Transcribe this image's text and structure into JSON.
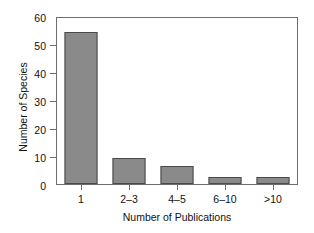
{
  "chart_data": {
    "type": "bar",
    "title": "",
    "subtitle": "",
    "xlabel": "Number of Publications",
    "ylabel": "Number of Species",
    "categories": [
      "1",
      "2–3",
      "4–5",
      "6–10",
      ">10"
    ],
    "values": [
      55,
      9.5,
      6.5,
      2.5,
      2.5
    ],
    "series": [
      {
        "name": "Number of Species",
        "values": [
          55,
          9.5,
          6.5,
          2.5,
          2.5
        ]
      }
    ],
    "ylim": [
      0,
      60
    ],
    "yticks": [
      0,
      10,
      20,
      30,
      40,
      50,
      60
    ],
    "ytick_labels": [
      "0",
      "10",
      "20",
      "30",
      "40",
      "50",
      "60"
    ],
    "grid": false,
    "legend": "none",
    "bar_color": "#8a8a8a",
    "bar_edge_color": "#4a4a4a",
    "axis_color": "#6e6e6e",
    "background_color": "#ffffff",
    "text_color": "#111111"
  }
}
